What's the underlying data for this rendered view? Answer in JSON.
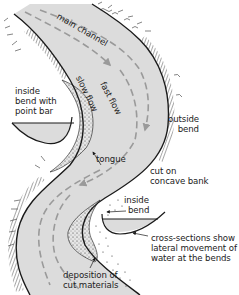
{
  "diagram": {
    "colors": {
      "water": "#dcdcdc",
      "ink": "#1a1a1a",
      "flow_arrow": "#9a9a9a",
      "background": "#ffffff"
    },
    "labels": {
      "main_channel": "main channel",
      "fast_flow": "fast flow",
      "slow_flow": "slow flow",
      "inside_bend_point_bar": [
        "inside",
        "bend with",
        "point bar"
      ],
      "outside_bend": [
        "outside",
        "bend"
      ],
      "tongue": "tongue",
      "cut_on_concave_bank": [
        "cut on",
        "concave bank"
      ],
      "inside_bend": [
        "inside",
        "bend"
      ],
      "cross_sections": [
        "cross-sections show",
        "lateral movement of",
        "water at the bends"
      ],
      "deposition": [
        "deposition of",
        "cut materials"
      ]
    }
  }
}
